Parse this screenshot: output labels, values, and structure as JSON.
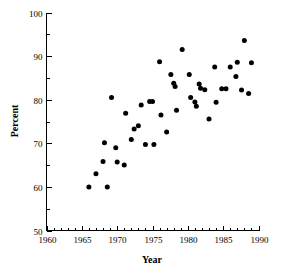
{
  "chart_data": {
    "type": "scatter",
    "title": "",
    "xlabel": "Year",
    "ylabel": "Percent",
    "xlim": [
      1960,
      1990
    ],
    "ylim": [
      50,
      100
    ],
    "xticks": [
      1960,
      1965,
      1970,
      1975,
      1980,
      1985,
      1990
    ],
    "xtick_labels": [
      "1960",
      "1965",
      "1970",
      "1975",
      "1980",
      "1985",
      "1990"
    ],
    "yticks": [
      50,
      60,
      70,
      80,
      90,
      100
    ],
    "ytick_labels": [
      "50",
      "60",
      "70",
      "80",
      "90",
      "100"
    ],
    "x_minor_tick_interval": 1,
    "y_minor_tick_interval": 5,
    "grid": false,
    "legend": false,
    "marker": "filled-circle",
    "marker_color": "#000000",
    "marker_size_px": 5,
    "points": [
      {
        "x": 1966.0,
        "y": 60.0
      },
      {
        "x": 1967.0,
        "y": 63.0
      },
      {
        "x": 1968.0,
        "y": 65.8
      },
      {
        "x": 1968.2,
        "y": 70.1
      },
      {
        "x": 1968.6,
        "y": 60.0
      },
      {
        "x": 1969.2,
        "y": 80.5
      },
      {
        "x": 1969.8,
        "y": 69.0
      },
      {
        "x": 1970.0,
        "y": 65.7
      },
      {
        "x": 1971.0,
        "y": 65.0
      },
      {
        "x": 1971.2,
        "y": 76.9
      },
      {
        "x": 1972.0,
        "y": 70.9
      },
      {
        "x": 1972.4,
        "y": 73.3
      },
      {
        "x": 1973.0,
        "y": 74.0
      },
      {
        "x": 1973.4,
        "y": 78.8
      },
      {
        "x": 1974.0,
        "y": 69.7
      },
      {
        "x": 1974.6,
        "y": 79.6
      },
      {
        "x": 1975.0,
        "y": 79.6
      },
      {
        "x": 1975.2,
        "y": 69.7
      },
      {
        "x": 1976.0,
        "y": 88.7
      },
      {
        "x": 1976.2,
        "y": 76.5
      },
      {
        "x": 1977.0,
        "y": 72.6
      },
      {
        "x": 1977.6,
        "y": 85.8
      },
      {
        "x": 1978.0,
        "y": 83.8
      },
      {
        "x": 1978.2,
        "y": 83.0
      },
      {
        "x": 1978.4,
        "y": 77.6
      },
      {
        "x": 1979.2,
        "y": 91.5
      },
      {
        "x": 1980.2,
        "y": 85.8
      },
      {
        "x": 1980.4,
        "y": 80.5
      },
      {
        "x": 1981.0,
        "y": 79.5
      },
      {
        "x": 1981.2,
        "y": 78.5
      },
      {
        "x": 1981.6,
        "y": 83.6
      },
      {
        "x": 1981.8,
        "y": 82.6
      },
      {
        "x": 1982.4,
        "y": 82.3
      },
      {
        "x": 1983.0,
        "y": 75.6
      },
      {
        "x": 1983.8,
        "y": 87.5
      },
      {
        "x": 1984.0,
        "y": 79.4
      },
      {
        "x": 1984.8,
        "y": 82.5
      },
      {
        "x": 1985.4,
        "y": 82.5
      },
      {
        "x": 1986.0,
        "y": 87.5
      },
      {
        "x": 1986.8,
        "y": 85.3
      },
      {
        "x": 1987.0,
        "y": 88.6
      },
      {
        "x": 1987.6,
        "y": 82.2
      },
      {
        "x": 1988.0,
        "y": 93.6
      },
      {
        "x": 1988.6,
        "y": 81.4
      },
      {
        "x": 1989.0,
        "y": 88.5
      }
    ]
  }
}
